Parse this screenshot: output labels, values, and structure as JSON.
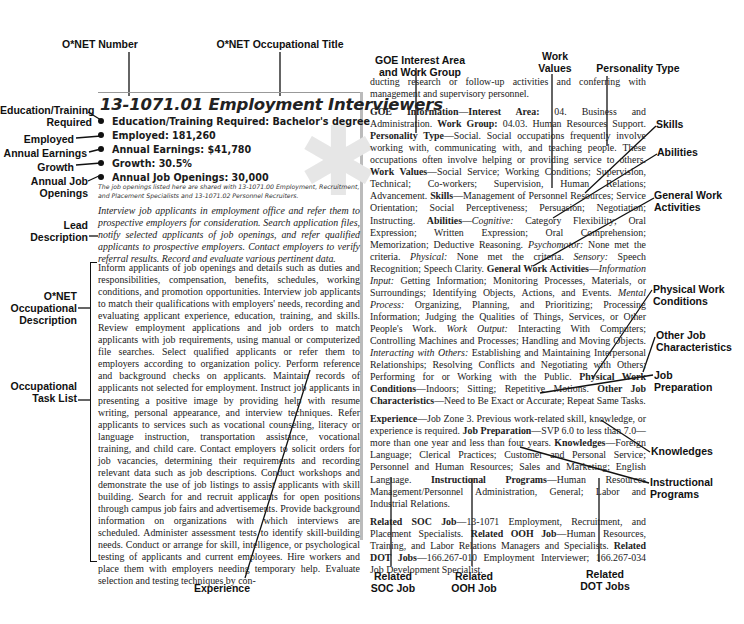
{
  "callouts": {
    "onet_number": "O*NET Number",
    "onet_title": "O*NET Occupational Title",
    "education": [
      "Education/Training",
      "Required"
    ],
    "employed": "Employed",
    "earnings": "Annual Earnings",
    "growth": "Growth",
    "openings": [
      "Annual Job",
      "Openings"
    ],
    "lead": [
      "Lead",
      "Description"
    ],
    "onet_desc": [
      "O*NET",
      "Occupational",
      "Description"
    ],
    "task_list": [
      "Occupational",
      "Task List"
    ],
    "experience": "Experience",
    "goe": [
      "GOE Interest Area",
      "and Work Group"
    ],
    "work_values": [
      "Work",
      "Values"
    ],
    "personality": "Personality Type",
    "skills": "Skills",
    "abilities": "Abilities",
    "gwa": [
      "General Work",
      "Activities"
    ],
    "physical": [
      "Physical Work",
      "Conditions"
    ],
    "other_job": [
      "Other Job",
      "Characteristics"
    ],
    "job_prep": [
      "Job",
      "Preparation"
    ],
    "knowledges": "Knowledges",
    "instr": [
      "Instructional",
      "Programs"
    ],
    "soc": [
      "Related",
      "SOC Job"
    ],
    "ooh": [
      "Related",
      "OOH Job"
    ],
    "dot": [
      "Related",
      "DOT Jobs"
    ]
  },
  "entry": {
    "title": "13-1071.01 Employment Interviewers",
    "bullets": [
      "Education/Training Required: Bachelor's degree",
      "Employed: 181,260",
      "Annual Earnings: $41,780",
      "Growth: 30.5%",
      "Annual Job Openings: 30,000"
    ],
    "note": "The job openings listed here are shared with 13-1071.00 Employment, Recruitment, and Placement Specialists and 13-1071.02 Personnel Recruiters.",
    "lead": "Interview job applicants in employment office and refer them to prospective employers for consideration. Search application files, notify selected applicants of job openings, and refer qualified applicants to prospective employers. Contact employers to verify referral results. Record and evaluate various pertinent data.",
    "description": "Inform applicants of job openings and details such as duties and responsibilities, compensation, benefits, schedules, working conditions, and promotion opportunities. Interview job applicants to match their qualifications with employers' needs, recording and evaluating applicant experience, education, training, and skills. Review employment applications and job orders to match applicants with job requirements, using manual or computerized file searches. Select qualified applicants or refer them to employers according to organization policy. Perform reference and background checks on applicants. Maintain records of applicants not selected for employment. Instruct job applicants in presenting a positive image by providing help with resume writing, personal appearance, and interview techniques. Refer applicants to services such as vocational counseling, literacy or language instruction, transportation assistance, vocational training, and child care. Contact employers to solicit orders for job vacancies, determining their requirements and recording relevant data such as job descriptions. Conduct workshops and demonstrate the use of job listings to assist applicants with skill building. Search for and recruit applicants for open positions through campus job fairs and advertisements. Provide background information on organizations with which interviews are scheduled. Administer assessment tests to identify skill-building needs. Conduct or arrange for skill, intelligence, or psychological testing of applicants and current employees. Hire workers and place them with employers needing temporary help. Evaluate selection and testing techniques by con-",
    "continuation": "ducting research or follow-up activities and conferring with management and supervisory personnel.",
    "goe_label": "GOE Information—Interest Area:",
    "goe_area": " 04. Business and Administration. ",
    "work_group_label": "Work Group:",
    "work_group": " 04.03. Human Resources Support. ",
    "personality_label": "Personality Type",
    "personality": "—Social. Social occupations frequently involve working with, communicating with, and teaching people. These occupations often involve helping or providing service to others. ",
    "work_values_label": "Work Values",
    "work_values": "—Social Service; Working Conditions; Supervision, Technical; Co-workers; Supervision, Human Relations; Advancement. ",
    "skills_label": "Skills",
    "skills": "—Management of Personnel Resources; Service Orientation; Social Perceptiveness; Persuasion; Negotiation; Instructing. ",
    "abilities_label": "Abilities",
    "abilities_cog_label": "Cognitive:",
    "abilities_cog": " Category Flexibility; Oral Expression; Written Expression; Oral Comprehension; Memorization; Deductive Reasoning. ",
    "abilities_psy_label": "Psychomotor:",
    "abilities_psy": " None met the criteria. ",
    "abilities_phys_label": "Physical:",
    "abilities_phys": " None met the criteria. ",
    "abilities_sens_label": "Sensory:",
    "abilities_sens": " Speech Recognition; Speech Clarity. ",
    "gwa_label": "General Work Activities",
    "gwa_input_label": "Information Input:",
    "gwa_input": " Getting Information; Monitoring Processes, Materials, or Surroundings; Identifying Objects, Actions, and Events. ",
    "gwa_mental_label": "Mental Process:",
    "gwa_mental": " Organizing, Planning, and Prioritizing; Processing Information; Judging the Qualities of Things, Services, or Other People's Work. ",
    "gwa_output_label": "Work Output:",
    "gwa_output": " Interacting With Computers; Controlling Machines and Processes; Handling and Moving Objects. ",
    "gwa_others_label": "Interacting with Others:",
    "gwa_others": " Establishing and Maintaining Interpersonal Relationships; Resolving Conflicts and Negotiating with Others; Performing for or Working with the Public. ",
    "physical_label": "Physical Work Conditions",
    "physical": "—Indoors; Sitting; Repetitive Motions. ",
    "other_label": "Other Job Characteristics",
    "other": "—Need to Be Exact or Accurate; Repeat Same Tasks.",
    "experience_label": "Experience",
    "experience": "—Job Zone 3. Previous work-related skill, knowledge, or experience is required. ",
    "prep_label": "Job Preparation",
    "prep": "—SVP 6.0 to less than 7.0—more than one year and less than four years. ",
    "knowledges_label": "Knowledges",
    "knowledges": "—Foreign Language; Clerical Practices; Customer and Personal Service; Personnel and Human Resources; Sales and Marketing; English Language. ",
    "instr_label": "Instructional Programs",
    "instr": "—Human Resources Management/Personnel Administration, General; Labor and Industrial Relations.",
    "soc_label": "Related SOC Job",
    "soc": "—13-1071 Employment, Recruitment, and Placement Specialists. ",
    "ooh_label": "Related OOH Job",
    "ooh": "—Human Resources, Training, and Labor Relations Managers and Specialists. ",
    "dot_label": "Related DOT Jobs",
    "dot": "—166.267-010 Employment Interviewer; 166.267-034 Job Development Specialist."
  }
}
